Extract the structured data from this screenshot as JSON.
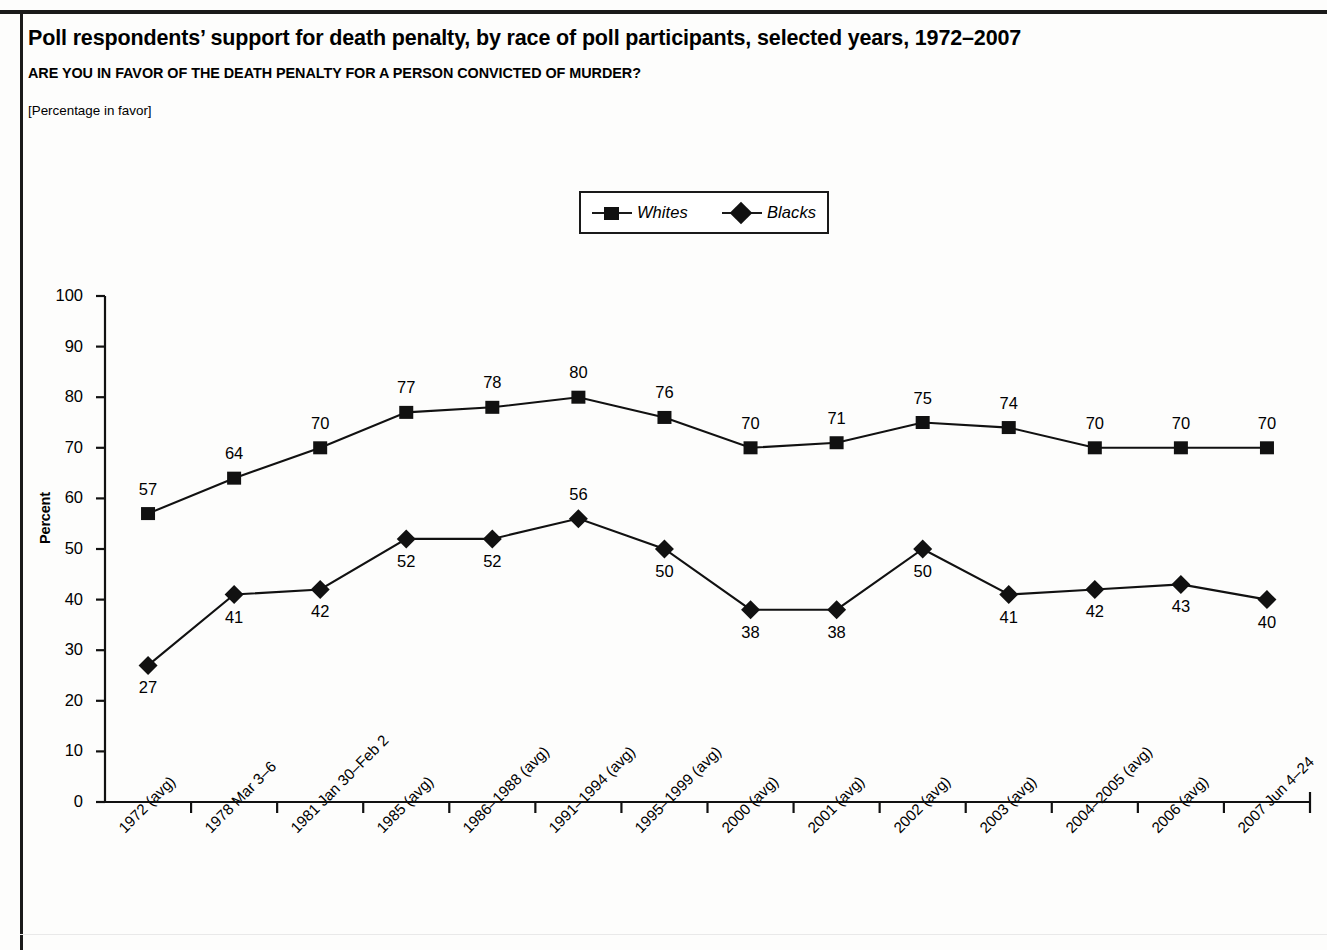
{
  "header": {
    "title": "Poll respondents’ support for death penalty, by race of poll participants, selected years, 1972–2007",
    "question": "ARE YOU IN FAVOR OF THE DEATH PENALTY FOR A PERSON CONVICTED OF MURDER?",
    "unit_note": "[Percentage in favor]"
  },
  "colors": {
    "ink": "#111111",
    "rule": "#1a1a1a",
    "background": "#ffffff"
  },
  "legend": {
    "position": "top-center",
    "items": [
      {
        "label": "Whites",
        "marker": "square"
      },
      {
        "label": "Blacks",
        "marker": "diamond"
      }
    ]
  },
  "chart_data": {
    "type": "line",
    "title": "Poll respondents’ support for death penalty, by race of poll participants, selected years, 1972–2007",
    "subtitle": "ARE YOU IN FAVOR OF THE DEATH PENALTY FOR A PERSON CONVICTED OF MURDER?",
    "xlabel": "",
    "ylabel": "Percent",
    "ylim": [
      0,
      100
    ],
    "yticks": [
      0,
      10,
      20,
      30,
      40,
      50,
      60,
      70,
      80,
      90,
      100
    ],
    "grid": false,
    "legend_position": "top-center",
    "data_labels": true,
    "categories": [
      "1972 (avg)",
      "1978 Mar 3–6",
      "1981 Jan 30–Feb 2",
      "1985 (avg)",
      "1986–1988 (avg)",
      "1991–1994 (avg)",
      "1995–1999 (avg)",
      "2000 (avg)",
      "2001 (avg)",
      "2002 (avg)",
      "2003 (avg)",
      "2004–2005 (avg)",
      "2006 (avg)",
      "2007 Jun 4–24"
    ],
    "series": [
      {
        "name": "Whites",
        "marker": "square",
        "label_position": "above",
        "values": [
          57,
          64,
          70,
          77,
          78,
          80,
          76,
          70,
          71,
          75,
          74,
          70,
          70,
          70
        ]
      },
      {
        "name": "Blacks",
        "marker": "diamond",
        "label_position": "below",
        "values": [
          27,
          41,
          42,
          52,
          52,
          56,
          50,
          38,
          38,
          50,
          41,
          42,
          43,
          40
        ]
      }
    ],
    "label_overrides": {
      "Whites": [
        "above",
        "above",
        "above",
        "above",
        "above",
        "above",
        "above",
        "above",
        "above",
        "above",
        "above",
        "above",
        "above",
        "above"
      ],
      "Blacks": [
        "below",
        "below",
        "below",
        "below",
        "below",
        "above",
        "below",
        "below",
        "below",
        "below",
        "below",
        "below",
        "below",
        "below"
      ]
    }
  }
}
